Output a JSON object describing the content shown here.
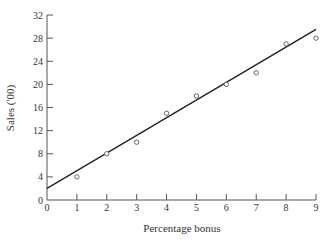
{
  "chart_data": {
    "type": "scatter",
    "title": "",
    "xlabel": "Percentage bonus",
    "ylabel": "Sales ('00)",
    "xlim": [
      0,
      9
    ],
    "ylim": [
      0,
      32
    ],
    "x_ticks": [
      0,
      1,
      2,
      3,
      4,
      5,
      6,
      7,
      8,
      9
    ],
    "y_ticks": [
      0,
      4,
      8,
      12,
      16,
      20,
      24,
      28,
      32
    ],
    "grid": false,
    "legend": null,
    "series": [
      {
        "name": "observations",
        "type": "scatter",
        "marker": "open-circle",
        "x": [
          1,
          2,
          3,
          4,
          5,
          6,
          7,
          8,
          9
        ],
        "y": [
          4,
          8,
          10,
          15,
          18,
          20,
          22,
          27,
          28
        ]
      },
      {
        "name": "fitted line",
        "type": "line",
        "x": [
          0,
          9
        ],
        "y": [
          2,
          29.5
        ]
      }
    ]
  },
  "colors": {
    "axis": "#555555",
    "line": "#222222",
    "marker": "#555555"
  }
}
